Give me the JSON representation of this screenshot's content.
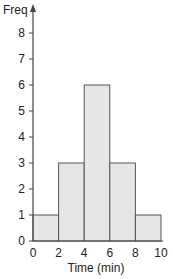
{
  "chart_data": {
    "type": "bar",
    "subtype": "histogram",
    "title": "",
    "xlabel": "Time (min)",
    "ylabel": "Freq",
    "bins": [
      [
        0,
        2
      ],
      [
        2,
        4
      ],
      [
        4,
        6
      ],
      [
        6,
        8
      ],
      [
        8,
        10
      ]
    ],
    "categories": [
      "0-2",
      "2-4",
      "4-6",
      "6-8",
      "8-10"
    ],
    "values": [
      1,
      3,
      6,
      3,
      1
    ],
    "xlim": [
      0,
      10
    ],
    "ylim": [
      0,
      8
    ],
    "xticks": [
      0,
      2,
      4,
      6,
      8,
      10
    ],
    "yticks": [
      0,
      1,
      2,
      3,
      4,
      5,
      6,
      7,
      8
    ],
    "grid": false,
    "legend": null,
    "colors": {
      "bar_fill": "#e6e6e6",
      "bar_stroke": "#555555",
      "axis": "#444444"
    }
  },
  "labels": {
    "ylabel": "Freq",
    "xlabel": "Time (min)"
  }
}
